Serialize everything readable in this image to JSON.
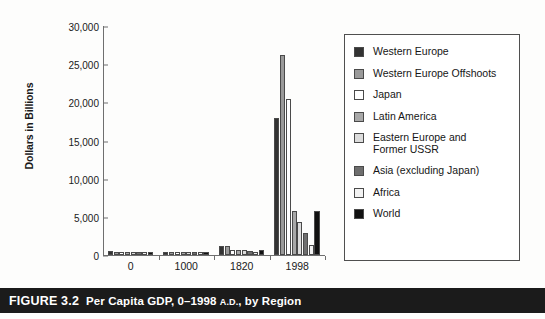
{
  "caption": {
    "figure_number": "FIGURE 3.2",
    "title_before": "Per Capita GDP, 0–1998",
    "ad": "A.D.",
    "title_after": ", by Region"
  },
  "legend": {
    "items": [
      {
        "label": "Western Europe",
        "color": "#333333"
      },
      {
        "label": "Western Europe Offshoots",
        "color": "#9a9a9a"
      },
      {
        "label": "Japan",
        "color": "#ffffff"
      },
      {
        "label": "Latin America",
        "color": "#a8a8a8"
      },
      {
        "label": "Eastern Europe and\nFormer USSR",
        "color": "#dcdcdc"
      },
      {
        "label": "Asia (excluding Japan)",
        "color": "#6e6e6e"
      },
      {
        "label": "Africa",
        "color": "#f2f2f2"
      },
      {
        "label": "World",
        "color": "#111111"
      }
    ]
  },
  "chart_data": {
    "type": "bar",
    "xlabel": "",
    "ylabel": "Dollars in Billions",
    "categories": [
      "0",
      "1000",
      "1820",
      "1998"
    ],
    "ytick_labels": [
      "0",
      "5,000",
      "10,000",
      "15,000",
      "20,000",
      "25,000",
      "30,000"
    ],
    "ytick_values": [
      0,
      5000,
      10000,
      15000,
      20000,
      25000,
      30000
    ],
    "ylim": [
      0,
      30000
    ],
    "grid": false,
    "legend_position": "right",
    "series": [
      {
        "name": "Western Europe",
        "color": "#333333",
        "values": [
          576,
          427,
          1204,
          17921
        ]
      },
      {
        "name": "Western Europe Offshoots",
        "color": "#9a9a9a",
        "values": [
          400,
          400,
          1202,
          26146
        ]
      },
      {
        "name": "Japan",
        "color": "#ffffff",
        "values": [
          400,
          425,
          669,
          20413
        ]
      },
      {
        "name": "Latin America",
        "color": "#a8a8a8",
        "values": [
          400,
          400,
          692,
          5795
        ]
      },
      {
        "name": "Eastern Europe and Former USSR",
        "color": "#dcdcdc",
        "values": [
          400,
          400,
          667,
          4354
        ]
      },
      {
        "name": "Asia (excluding Japan)",
        "color": "#6e6e6e",
        "values": [
          450,
          450,
          575,
          2936
        ]
      },
      {
        "name": "Africa",
        "color": "#f2f2f2",
        "values": [
          430,
          425,
          418,
          1368
        ]
      },
      {
        "name": "World",
        "color": "#111111",
        "values": [
          444,
          435,
          667,
          5709
        ]
      }
    ]
  }
}
